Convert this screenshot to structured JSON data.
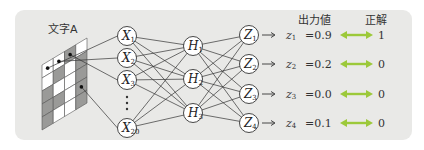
{
  "title_char": "文字A",
  "headers": {
    "output": "出力値",
    "answer": "正解"
  },
  "input_layer": {
    "nodes": [
      {
        "label": "X",
        "sub": "1"
      },
      {
        "label": "X",
        "sub": "2"
      },
      {
        "label": "X",
        "sub": "3"
      },
      {
        "label": "X",
        "sub": "20"
      }
    ],
    "ellipsis": "⋮"
  },
  "hidden_layer": {
    "nodes": [
      {
        "label": "H",
        "sub": "1"
      },
      {
        "label": "H",
        "sub": "2"
      },
      {
        "label": "H",
        "sub": "3"
      }
    ]
  },
  "output_layer": {
    "nodes": [
      {
        "label": "Z",
        "sub": "1"
      },
      {
        "label": "Z",
        "sub": "2"
      },
      {
        "label": "Z",
        "sub": "3"
      },
      {
        "label": "Z",
        "sub": "4"
      }
    ]
  },
  "outputs": [
    {
      "var": "z",
      "sub": "1",
      "eq": "=0.9",
      "answer": "1"
    },
    {
      "var": "z",
      "sub": "2",
      "eq": "=0.2",
      "answer": "0"
    },
    {
      "var": "z",
      "sub": "3",
      "eq": "=0.0",
      "answer": "0"
    },
    {
      "var": "z",
      "sub": "4",
      "eq": "=0.1",
      "answer": "0"
    }
  ],
  "colors": {
    "panel": "#e9e9e7",
    "arrow_green": "#9cc93a",
    "cell_gray": "#9a9a98",
    "cell_white": "#ffffff",
    "line": "#333333"
  },
  "grid": {
    "rows": 5,
    "cols": 4,
    "pattern": [
      [
        0,
        0,
        1,
        0
      ],
      [
        0,
        1,
        0,
        1
      ],
      [
        1,
        0,
        0,
        1
      ],
      [
        1,
        1,
        0,
        1
      ],
      [
        1,
        0,
        0,
        1
      ]
    ]
  }
}
